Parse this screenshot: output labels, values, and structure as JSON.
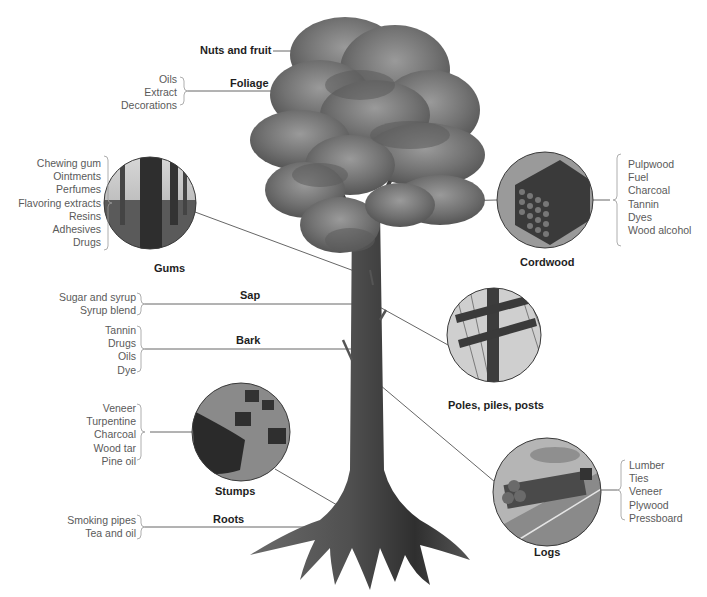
{
  "diagram": {
    "parts": [
      {
        "id": "nuts",
        "label": "Nuts and fruit",
        "products": []
      },
      {
        "id": "foliage",
        "label": "Foliage",
        "products": [
          "Oils",
          "Extract",
          "Decorations"
        ]
      },
      {
        "id": "gums",
        "label": "Gums",
        "products": [
          "Chewing gum",
          "Ointments",
          "Perfumes",
          "Flavoring extracts",
          "Resins",
          "Adhesives",
          "Drugs"
        ]
      },
      {
        "id": "cordwood",
        "label": "Cordwood",
        "products": [
          "Pulpwood",
          "Fuel",
          "Charcoal",
          "Tannin",
          "Dyes",
          "Wood alcohol"
        ]
      },
      {
        "id": "sap",
        "label": "Sap",
        "products": [
          "Sugar and syrup",
          "Syrup blend"
        ]
      },
      {
        "id": "bark",
        "label": "Bark",
        "products": [
          "Tannin",
          "Drugs",
          "Oils",
          "Dye"
        ]
      },
      {
        "id": "poles",
        "label": "Poles, piles, posts",
        "products": []
      },
      {
        "id": "stumps",
        "label": "Stumps",
        "products": [
          "Veneer",
          "Turpentine",
          "Charcoal",
          "Wood tar",
          "Pine oil"
        ]
      },
      {
        "id": "logs",
        "label": "Logs",
        "products": [
          "Lumber",
          "Ties",
          "Veneer",
          "Plywood",
          "Pressboard"
        ]
      },
      {
        "id": "roots",
        "label": "Roots",
        "products": [
          "Smoking pipes",
          "Tea and oil"
        ]
      }
    ],
    "colors": {
      "label": "#1e1e1e",
      "list_text": "#5a5a5a",
      "leader_line": "#555555",
      "foliage": "#6f6f6f",
      "trunk": "#4a4a4a",
      "circle_border": "#3a3a3a"
    }
  }
}
